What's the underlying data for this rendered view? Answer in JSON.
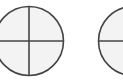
{
  "colors": {
    "background": "#ffffff",
    "fill": "#f3f3f3",
    "stroke": "#444444"
  },
  "shapes": [
    {
      "name": "crosshair-circle-1",
      "cx": 29,
      "cy": 41,
      "r": 35
    },
    {
      "name": "crosshair-circle-2",
      "cx": 133,
      "cy": 41,
      "r": 35
    }
  ]
}
